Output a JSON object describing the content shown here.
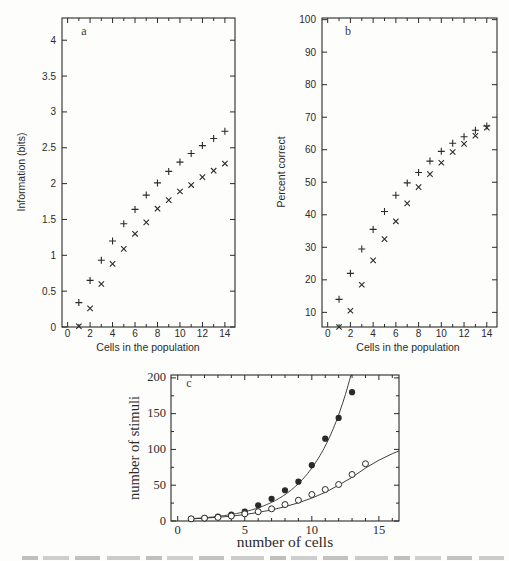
{
  "figure": {
    "background": "#fdfdfb",
    "ink": "#2a2a2a",
    "panel_letters": {
      "a": "a",
      "b": "b",
      "c": "c"
    }
  },
  "chart_data": [
    {
      "panel": "a",
      "type": "scatter",
      "xlabel": "Cells in the population",
      "ylabel": "Information (bits)",
      "xlim": [
        -0.5,
        14.9
      ],
      "ylim": [
        0,
        4.31
      ],
      "xticks": [
        0,
        2,
        4,
        6,
        8,
        10,
        12,
        14
      ],
      "xtick_labels": [
        "0",
        "2",
        "4",
        "6",
        "8",
        "10",
        "12",
        "14"
      ],
      "xminor": [
        1,
        3,
        5,
        7,
        9,
        11,
        13
      ],
      "yticks": [
        0,
        0.5,
        1,
        1.5,
        2,
        2.5,
        3,
        3.5,
        4
      ],
      "ytick_labels": [
        "0",
        "0.5",
        "1",
        "1.5",
        "2",
        "2.5",
        "3",
        "3.5",
        "4"
      ],
      "yminor": [],
      "x": [
        1,
        2,
        3,
        4,
        5,
        6,
        7,
        8,
        9,
        10,
        11,
        12,
        13,
        14
      ],
      "series": [
        {
          "name": "plus-markers",
          "marker": "plus",
          "values": [
            0.34,
            0.65,
            0.93,
            1.2,
            1.44,
            1.64,
            1.84,
            2.01,
            2.17,
            2.3,
            2.42,
            2.53,
            2.63,
            2.73
          ]
        },
        {
          "name": "cross-markers",
          "marker": "cross",
          "values": [
            0.01,
            0.26,
            0.6,
            0.88,
            1.09,
            1.3,
            1.46,
            1.65,
            1.77,
            1.89,
            1.98,
            2.09,
            2.18,
            2.28
          ]
        }
      ]
    },
    {
      "panel": "b",
      "type": "scatter",
      "xlabel": "Cells in the population",
      "ylabel": "Percent correct",
      "xlim": [
        -0.5,
        14.9
      ],
      "ylim": [
        5.5,
        100.5
      ],
      "xticks": [
        0,
        2,
        4,
        6,
        8,
        10,
        12,
        14
      ],
      "xtick_labels": [
        "0",
        "2",
        "4",
        "6",
        "8",
        "10",
        "12",
        "14"
      ],
      "xminor": [
        1,
        3,
        5,
        7,
        9,
        11,
        13
      ],
      "yticks": [
        10,
        20,
        30,
        40,
        50,
        60,
        70,
        80,
        90,
        100
      ],
      "ytick_labels": [
        "10",
        "20",
        "30",
        "40",
        "50",
        "60",
        "70",
        "80",
        "90",
        "100"
      ],
      "yminor": [],
      "x": [
        1,
        2,
        3,
        4,
        5,
        6,
        7,
        8,
        9,
        10,
        11,
        12,
        13,
        14
      ],
      "series": [
        {
          "name": "plus-markers",
          "marker": "plus",
          "values": [
            14,
            22,
            29.5,
            35.5,
            41,
            46,
            49.8,
            53,
            56.5,
            59.5,
            62,
            64,
            66,
            67.3
          ]
        },
        {
          "name": "cross-markers",
          "marker": "cross",
          "values": [
            5.5,
            10.5,
            18.5,
            26,
            32.5,
            38,
            43.5,
            48.5,
            52.5,
            56,
            59.3,
            61.8,
            64.3,
            66.8
          ]
        }
      ]
    },
    {
      "panel": "c",
      "type": "scatter",
      "xlabel": "number of cells",
      "ylabel": "number of stimuli",
      "xlim": [
        -0.5,
        16.5
      ],
      "ylim": [
        0,
        204
      ],
      "xticks": [
        0,
        5,
        10,
        15
      ],
      "xtick_labels": [
        "0",
        "5",
        "10",
        "15"
      ],
      "xminor": [
        1,
        2,
        3,
        4,
        6,
        7,
        8,
        9,
        11,
        12,
        13,
        14,
        16
      ],
      "yticks": [
        0,
        50,
        100,
        150,
        200
      ],
      "ytick_labels": [
        "0",
        "50",
        "100",
        "150",
        "200"
      ],
      "yminor": [
        25,
        75,
        125,
        175
      ],
      "series": [
        {
          "name": "filled-circles",
          "marker": "filled-circle",
          "x": [
            1,
            2,
            3,
            4,
            5,
            6,
            7,
            8,
            9,
            10,
            11,
            12,
            13
          ],
          "values": [
            3,
            4,
            6,
            9,
            13,
            22,
            31,
            43,
            55,
            78,
            115,
            144,
            180
          ],
          "fit": {
            "type": "exp",
            "a": 2.28,
            "b": 0.348,
            "x_start": 0.9,
            "x_end": 13.3
          }
        },
        {
          "name": "open-circles",
          "marker": "open-circle",
          "x": [
            1,
            2,
            3,
            4,
            5,
            6,
            7,
            8,
            9,
            10,
            11,
            12,
            13,
            14
          ],
          "values": [
            3,
            4,
            5,
            7,
            10,
            13,
            17,
            23,
            29,
            37,
            44,
            51,
            65,
            80
          ],
          "fit_points": [
            [
              0.9,
              2.8
            ],
            [
              2,
              4
            ],
            [
              3,
              5.2
            ],
            [
              4,
              6.8
            ],
            [
              5,
              9
            ],
            [
              6,
              12
            ],
            [
              7,
              15.5
            ],
            [
              8,
              20
            ],
            [
              9,
              25.5
            ],
            [
              10,
              32
            ],
            [
              11,
              40
            ],
            [
              12,
              50
            ],
            [
              13,
              61
            ],
            [
              14,
              74
            ],
            [
              15,
              85
            ],
            [
              16,
              94
            ],
            [
              16.5,
              98
            ]
          ]
        }
      ]
    }
  ]
}
